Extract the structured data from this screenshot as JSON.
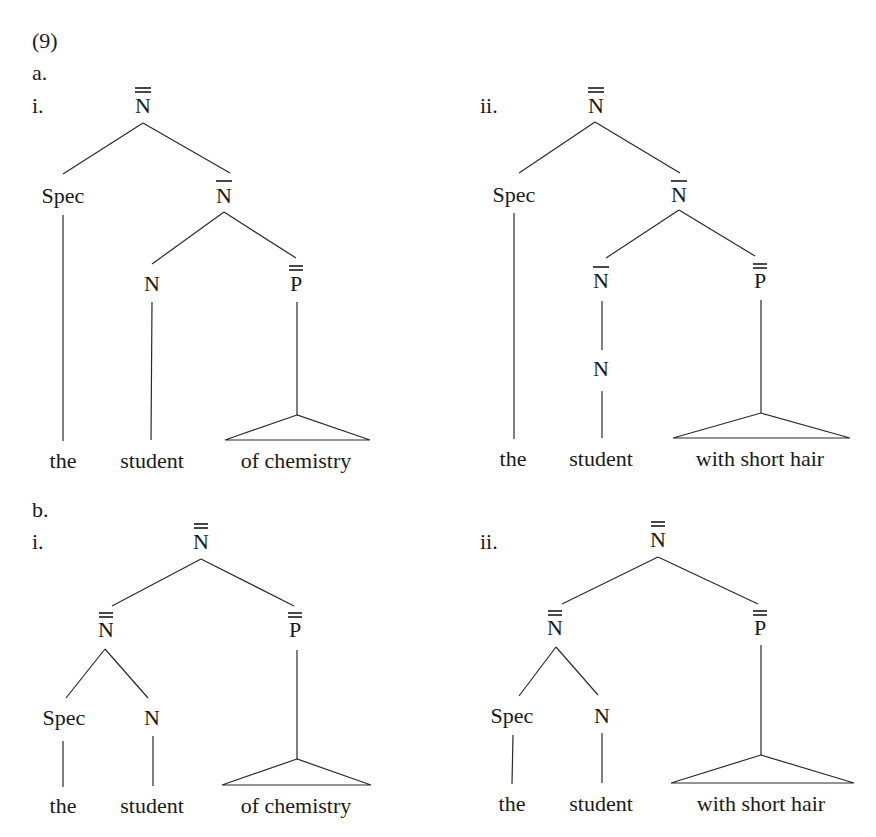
{
  "example_number": "(9)",
  "sections": [
    {
      "label": "a.",
      "trees": [
        {
          "label": "i.",
          "nodes": {
            "root": {
              "cat": "N",
              "bars": 2
            },
            "spec": {
              "cat": "Spec",
              "bars": 0
            },
            "nbar": {
              "cat": "N",
              "bars": 1
            },
            "n": {
              "cat": "N",
              "bars": 0
            },
            "pp": {
              "cat": "P",
              "bars": 2
            }
          },
          "words": [
            "the",
            "student",
            "of chemistry"
          ]
        },
        {
          "label": "ii.",
          "nodes": {
            "root": {
              "cat": "N",
              "bars": 2
            },
            "spec": {
              "cat": "Spec",
              "bars": 0
            },
            "nbar": {
              "cat": "N",
              "bars": 1
            },
            "nbar2": {
              "cat": "N",
              "bars": 1
            },
            "n": {
              "cat": "N",
              "bars": 0
            },
            "pp": {
              "cat": "P",
              "bars": 2
            }
          },
          "words": [
            "the",
            "student",
            "with short hair"
          ]
        }
      ]
    },
    {
      "label": "b.",
      "trees": [
        {
          "label": "i.",
          "nodes": {
            "root": {
              "cat": "N",
              "bars": 2
            },
            "npp": {
              "cat": "N",
              "bars": 2
            },
            "pp": {
              "cat": "P",
              "bars": 2
            },
            "spec": {
              "cat": "Spec",
              "bars": 0
            },
            "n": {
              "cat": "N",
              "bars": 0
            }
          },
          "words": [
            "the",
            "student",
            "of chemistry"
          ]
        },
        {
          "label": "ii.",
          "nodes": {
            "root": {
              "cat": "N",
              "bars": 2
            },
            "npp": {
              "cat": "N",
              "bars": 2
            },
            "pp": {
              "cat": "P",
              "bars": 2
            },
            "spec": {
              "cat": "Spec",
              "bars": 0
            },
            "n": {
              "cat": "N",
              "bars": 0
            }
          },
          "words": [
            "the",
            "student",
            "with short hair"
          ]
        }
      ]
    }
  ]
}
